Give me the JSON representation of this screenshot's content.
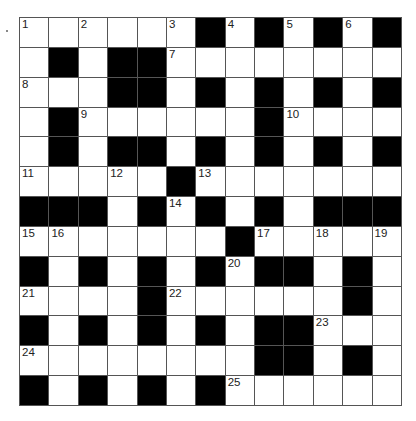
{
  "puzzle": {
    "rows": 13,
    "cols": 13,
    "colors": {
      "block": "#000000",
      "cell": "#ffffff",
      "line": "#555555"
    },
    "layout": [
      "WWWWWWBWBWBWB",
      "WBWBBWWWWWWWW",
      "WWWBBWBWBWBWB",
      "WBWWWWWWBWWWW",
      "WBWBBWBWBWBWB",
      "WWWWWBWWWWWWW",
      "BBBWBWBWBWBBB",
      "WWWWWWWBWWWWW",
      "BWBWBWBWBBWBW",
      "WWWWBWWWWWWBW",
      "BWBWBWBWBBWWW",
      "WWWWWWWWBBWBW",
      "BWBWBWBWWWWWW"
    ],
    "numbers": [
      {
        "r": 0,
        "c": 0,
        "n": "1"
      },
      {
        "r": 0,
        "c": 2,
        "n": "2"
      },
      {
        "r": 0,
        "c": 5,
        "n": "3"
      },
      {
        "r": 0,
        "c": 7,
        "n": "4"
      },
      {
        "r": 0,
        "c": 9,
        "n": "5"
      },
      {
        "r": 0,
        "c": 11,
        "n": "6"
      },
      {
        "r": 1,
        "c": 5,
        "n": "7"
      },
      {
        "r": 2,
        "c": 0,
        "n": "8"
      },
      {
        "r": 3,
        "c": 2,
        "n": "9"
      },
      {
        "r": 3,
        "c": 9,
        "n": "10"
      },
      {
        "r": 5,
        "c": 0,
        "n": "11"
      },
      {
        "r": 5,
        "c": 3,
        "n": "12"
      },
      {
        "r": 5,
        "c": 6,
        "n": "13"
      },
      {
        "r": 6,
        "c": 5,
        "n": "14"
      },
      {
        "r": 7,
        "c": 0,
        "n": "15"
      },
      {
        "r": 7,
        "c": 1,
        "n": "16"
      },
      {
        "r": 7,
        "c": 8,
        "n": "17"
      },
      {
        "r": 7,
        "c": 10,
        "n": "18"
      },
      {
        "r": 7,
        "c": 12,
        "n": "19"
      },
      {
        "r": 8,
        "c": 7,
        "n": "20"
      },
      {
        "r": 9,
        "c": 0,
        "n": "21"
      },
      {
        "r": 9,
        "c": 5,
        "n": "22"
      },
      {
        "r": 10,
        "c": 10,
        "n": "23"
      },
      {
        "r": 11,
        "c": 0,
        "n": "24"
      },
      {
        "r": 12,
        "c": 7,
        "n": "25"
      }
    ]
  }
}
